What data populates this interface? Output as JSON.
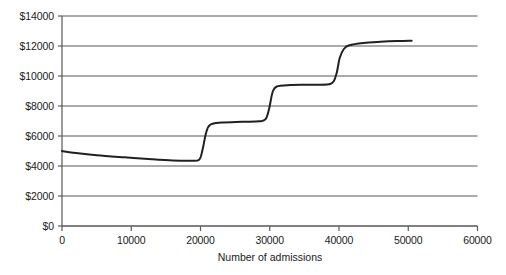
{
  "chart_data": {
    "type": "line",
    "title": "",
    "xlabel": "Number of admissions",
    "ylabel": "",
    "xlim": [
      0,
      60000
    ],
    "ylim": [
      0,
      14000
    ],
    "grid": true,
    "legend": null,
    "y_ticks": [
      0,
      2000,
      4000,
      6000,
      8000,
      10000,
      12000,
      14000
    ],
    "y_tick_labels": [
      "$0",
      "$2000",
      "$4000",
      "$6000",
      "$8000",
      "$10000",
      "$12000",
      "$14000"
    ],
    "x_ticks": [
      0,
      10000,
      20000,
      30000,
      40000,
      50000,
      60000
    ],
    "x_tick_labels": [
      "0",
      "10000",
      "20000",
      "30000",
      "40000",
      "50000",
      "60000"
    ],
    "series": [
      {
        "name": "Average cost per admission",
        "color": "#231f20",
        "line_width": 2,
        "x": [
          0,
          2000,
          5000,
          9000,
          13000,
          16000,
          18500,
          19800,
          20300,
          20800,
          21400,
          23000,
          26000,
          28500,
          29400,
          29900,
          30400,
          31000,
          33000,
          36000,
          38800,
          39600,
          40100,
          40700,
          41500,
          43500,
          46000,
          48500,
          50500
        ],
        "y": [
          5000,
          4870,
          4720,
          4580,
          4450,
          4370,
          4350,
          4420,
          5100,
          6200,
          6750,
          6900,
          6950,
          6980,
          7120,
          7800,
          8900,
          9300,
          9400,
          9420,
          9480,
          10100,
          11200,
          11800,
          12050,
          12200,
          12280,
          12330,
          12350
        ]
      }
    ]
  },
  "axis": {
    "tick_color": "#595959",
    "grid_color": "#595959",
    "text_color": "#1a1a1a"
  }
}
